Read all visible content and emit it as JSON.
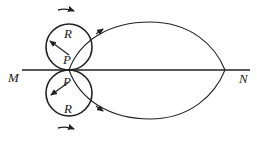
{
  "diagram": {
    "labels": {
      "M": "M",
      "N": "N",
      "P_top": "P",
      "P_bottom": "P",
      "R_top": "R",
      "R_bottom": "R"
    },
    "geometry": {
      "line_y": 70,
      "line_x1": 22,
      "line_x2": 250,
      "circle_radius": 23,
      "top_circle_center": [
        69,
        47
      ],
      "bottom_circle_center": [
        69,
        93
      ],
      "point_P": [
        69,
        70
      ],
      "point_N": [
        225,
        70
      ]
    },
    "colors": {
      "stroke": "#222222",
      "background": "#ffffff"
    }
  }
}
